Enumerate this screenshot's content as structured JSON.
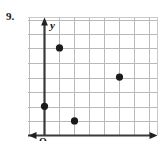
{
  "figure": {
    "problem_number": "9.",
    "axis_labels": {
      "x": "x",
      "y": "y",
      "origin": "O"
    }
  },
  "chart_data": {
    "type": "scatter",
    "title": "",
    "xlabel": "x",
    "ylabel": "y",
    "origin_label": "O",
    "grid": true,
    "grid_step": 1,
    "xlim": [
      0,
      7
    ],
    "ylim": [
      0,
      8
    ],
    "x_tick_labels": [],
    "y_tick_labels": [],
    "legend": null,
    "series": [
      {
        "name": "points",
        "marker": "filled-circle",
        "color": "#1a1a1a",
        "points": [
          {
            "x": 0,
            "y": 2
          },
          {
            "x": 1,
            "y": 6
          },
          {
            "x": 2,
            "y": 1
          },
          {
            "x": 5,
            "y": 4
          }
        ]
      }
    ]
  },
  "colors": {
    "grid_line": "#b9b9b9",
    "axis_line": "#3a3a3a",
    "point_fill": "#1a1a1a",
    "background": "#ffffff",
    "frame": "#c9c9c9"
  }
}
